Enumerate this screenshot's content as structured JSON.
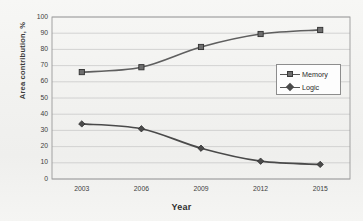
{
  "chart_data": {
    "type": "line",
    "title": "",
    "xlabel": "Year",
    "ylabel": "Area contribution, %",
    "categories": [
      "2003",
      "2006",
      "2009",
      "2012",
      "2015"
    ],
    "x": [
      2003,
      2006,
      2009,
      2012,
      2015
    ],
    "series": [
      {
        "name": "Memory",
        "marker": "square",
        "color": "#5f5f5f",
        "values": [
          66,
          69,
          81.5,
          89.5,
          92
        ]
      },
      {
        "name": "Logic",
        "marker": "diamond",
        "color": "#4a4a4a",
        "values": [
          34,
          31,
          19,
          11,
          9
        ]
      }
    ],
    "ylim": [
      0,
      100
    ],
    "ytick_step": 10,
    "yticks": [
      "0",
      "10",
      "20",
      "30",
      "40",
      "50",
      "60",
      "70",
      "80",
      "90",
      "100"
    ],
    "grid": "horizontal",
    "legend_position": "top-right-inside",
    "axis_frame": true,
    "background": "#f4f4f2",
    "gridline_color": "#c9c9c9",
    "frame_color": "#9a9a9a"
  },
  "legend": {
    "entries": [
      {
        "label": "Memory",
        "marker": "square-marker-icon"
      },
      {
        "label": "Logic",
        "marker": "diamond-marker-icon"
      }
    ]
  }
}
